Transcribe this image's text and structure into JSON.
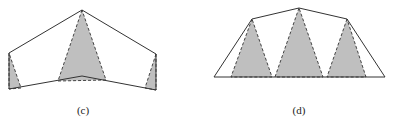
{
  "colors": {
    "outline": "#333333",
    "shade_fill": "#bfbfbf",
    "shade_edge": "#444444",
    "background": "#ffffff"
  },
  "figures": [
    {
      "id": "c",
      "label": "(c)",
      "label_pos": [
        83,
        114
      ],
      "outline": [
        [
          9,
          53
        ],
        [
          82,
          10
        ],
        [
          156,
          54
        ],
        [
          156,
          90
        ],
        [
          82,
          76
        ],
        [
          9,
          89
        ]
      ],
      "shaded_triangles": [
        [
          [
            9,
            53
          ],
          [
            9,
            89
          ],
          [
            21,
            88
          ]
        ],
        [
          [
            82,
            10
          ],
          [
            58,
            81
          ],
          [
            106,
            80
          ]
        ],
        [
          [
            156,
            54
          ],
          [
            145,
            88
          ],
          [
            156,
            90
          ]
        ]
      ]
    },
    {
      "id": "d",
      "label": "(d)",
      "label_pos": [
        299,
        114
      ],
      "outline": [
        [
          214,
          77
        ],
        [
          252,
          19
        ],
        [
          299,
          8
        ],
        [
          347,
          19
        ],
        [
          385,
          77
        ]
      ],
      "shaded_triangles": [
        [
          [
            252,
            19
          ],
          [
            231,
            77
          ],
          [
            272,
            77
          ]
        ],
        [
          [
            299,
            8
          ],
          [
            275,
            77
          ],
          [
            323,
            77
          ]
        ],
        [
          [
            347,
            19
          ],
          [
            327,
            77
          ],
          [
            366,
            77
          ]
        ]
      ]
    }
  ]
}
